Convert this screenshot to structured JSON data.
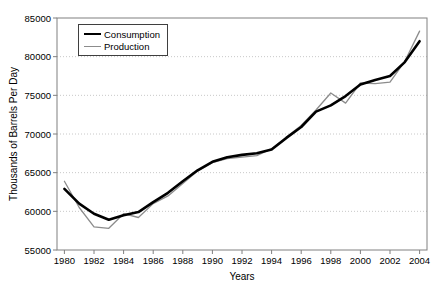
{
  "chart_data": {
    "type": "line",
    "title": "",
    "xlabel": "Years",
    "ylabel": "Thousands of Barrels Per Day",
    "x": [
      1980,
      1981,
      1982,
      1983,
      1984,
      1985,
      1986,
      1987,
      1988,
      1989,
      1990,
      1991,
      1992,
      1993,
      1994,
      1995,
      1996,
      1997,
      1998,
      1999,
      2000,
      2001,
      2002,
      2003,
      2004
    ],
    "x_tick_labels": [
      "1980",
      "1982",
      "1984",
      "1986",
      "1988",
      "1990",
      "1992",
      "1994",
      "1996",
      "1998",
      "2000",
      "2002",
      "2004"
    ],
    "y_tick_labels": [
      "55000",
      "60000",
      "65000",
      "70000",
      "75000",
      "80000",
      "85000"
    ],
    "y_ticks": [
      55000,
      60000,
      65000,
      70000,
      75000,
      80000,
      85000
    ],
    "ylim": [
      55000,
      85000
    ],
    "grid": "horizontal-dotted",
    "legend_position": "top-left-inside",
    "series": [
      {
        "name": "Consumption",
        "color": "#000000",
        "stroke_width": 2.6,
        "values": [
          62900,
          61000,
          59700,
          58900,
          59500,
          59900,
          61200,
          62400,
          63900,
          65300,
          66400,
          67000,
          67300,
          67500,
          68000,
          69500,
          70900,
          72900,
          73700,
          74900,
          76400,
          77000,
          77500,
          79300,
          82000
        ]
      },
      {
        "name": "Production",
        "color": "#8c8c8c",
        "stroke_width": 1.3,
        "values": [
          63900,
          60500,
          58000,
          57800,
          59700,
          59200,
          61000,
          62000,
          63600,
          65200,
          66300,
          66800,
          67000,
          67200,
          68100,
          69600,
          71100,
          73100,
          75300,
          74000,
          76600,
          76500,
          76700,
          79400,
          83300
        ]
      }
    ]
  },
  "colors": {
    "gridline": "#c8c8c8",
    "plot_border": "#808080",
    "tick_text": "#000000",
    "background": "#ffffff"
  }
}
